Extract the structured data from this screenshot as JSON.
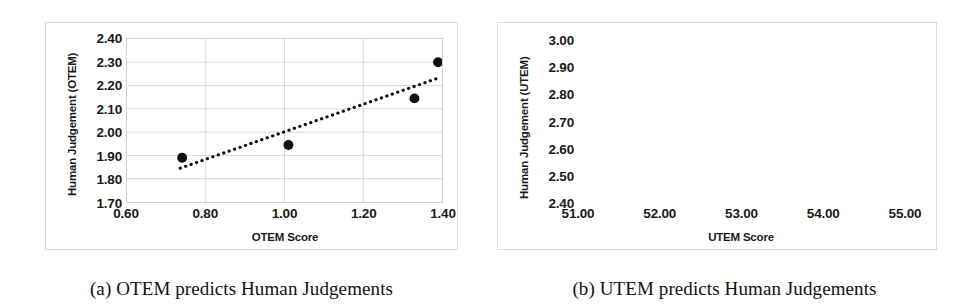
{
  "figure": {
    "subfigures": [
      {
        "caption": "(a) OTEM predicts Human Judgements",
        "chart_data": {
          "type": "scatter",
          "title": "",
          "xlabel": "OTEM Score",
          "ylabel": "Human Judgement (OTEM)",
          "xlim": [
            0.6,
            1.4
          ],
          "ylim": [
            1.7,
            2.4
          ],
          "xticks": [
            "0.60",
            "0.80",
            "1.00",
            "1.20",
            "1.40"
          ],
          "yticks": [
            "1.70",
            "1.80",
            "1.90",
            "2.00",
            "2.10",
            "2.20",
            "2.30",
            "2.40"
          ],
          "xtick_values": [
            0.6,
            0.8,
            1.0,
            1.2,
            1.4
          ],
          "ytick_values": [
            1.7,
            1.8,
            1.9,
            2.0,
            2.1,
            2.2,
            2.3,
            2.4
          ],
          "grid": true,
          "legend": "none",
          "marker_color": "#111111",
          "points": [
            {
              "x": 0.74,
              "y": 1.89
            },
            {
              "x": 1.01,
              "y": 1.945
            },
            {
              "x": 1.33,
              "y": 2.145
            },
            {
              "x": 1.39,
              "y": 2.3
            }
          ],
          "trendline": {
            "style": "dotted",
            "color": "#111111",
            "x_start": 0.735,
            "y_start": 1.845,
            "x_end": 1.395,
            "y_end": 2.235
          }
        }
      },
      {
        "caption": "(b) UTEM predicts Human Judgements",
        "chart_data": {
          "type": "scatter",
          "title": "",
          "xlabel": "UTEM Score",
          "ylabel": "Human Judgement (UTEM)",
          "xlim": [
            51.0,
            55.0
          ],
          "ylim": [
            2.4,
            3.0
          ],
          "xticks": [
            "51.00",
            "52.00",
            "53.00",
            "54.00",
            "55.00"
          ],
          "yticks": [
            "2.40",
            "2.50",
            "2.60",
            "2.70",
            "2.80",
            "2.90",
            "3.00"
          ],
          "xtick_values": [
            51.0,
            52.0,
            53.0,
            54.0,
            55.0
          ],
          "ytick_values": [
            2.4,
            2.5,
            2.6,
            2.7,
            2.8,
            2.9,
            3.0
          ],
          "grid": true,
          "legend": "none",
          "marker_color": "#111111",
          "points": [
            {
              "x": 51.7,
              "y": 2.52
            },
            {
              "x": 52.05,
              "y": 2.48
            },
            {
              "x": 53.73,
              "y": 2.885
            },
            {
              "x": 54.8,
              "y": 2.75
            }
          ],
          "trendline": {
            "style": "dotted",
            "color": "#111111",
            "x_start": 51.72,
            "y_start": 2.525,
            "x_end": 54.9,
            "y_end": 2.845
          }
        }
      }
    ]
  }
}
